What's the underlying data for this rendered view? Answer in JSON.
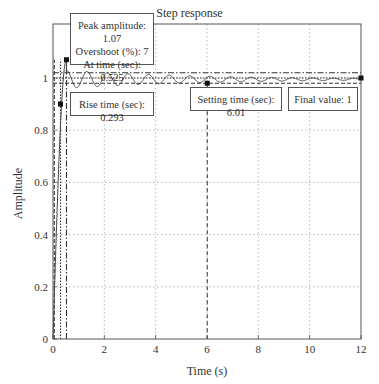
{
  "chart_data": {
    "type": "line",
    "title": "Step response",
    "xlabel": "Time (s)",
    "ylabel": "Amplitude",
    "xlim": [
      0,
      12
    ],
    "ylim": [
      0,
      1.1
    ],
    "xticks": [
      0,
      2,
      4,
      6,
      8,
      10,
      12
    ],
    "yticks": [
      0,
      0.2,
      0.4,
      0.6,
      0.8,
      1
    ],
    "grid": true,
    "series": [
      {
        "name": "Step response",
        "description": "Underdamped response rising from 0, peaking at 1.07 near t=0.525 s, then oscillating with small decaying amplitude around 1",
        "x": [
          0,
          0.15,
          0.293,
          0.4,
          0.525,
          0.7,
          1.0,
          1.3,
          1.6,
          2.0,
          2.5,
          3.0,
          4.0,
          5.0,
          6.01,
          8.0,
          10.0,
          12.0
        ],
        "y": [
          0,
          0.5,
          0.9,
          1.02,
          1.07,
          1.0,
          0.97,
          1.01,
          0.97,
          1.01,
          0.97,
          1.01,
          0.98,
          1.01,
          0.98,
          0.99,
          1.0,
          1.0
        ]
      }
    ],
    "reference_lines": [
      {
        "type": "horizontal",
        "y": 1.02,
        "style": "dash-dot",
        "label": "upper settling bound"
      },
      {
        "type": "horizontal",
        "y": 1.0,
        "style": "dotted",
        "label": "final value"
      },
      {
        "type": "horizontal",
        "y": 0.98,
        "style": "dashed",
        "label": "lower settling bound"
      },
      {
        "type": "vertical",
        "x": 0.293,
        "style": "dotted",
        "label": "rise time"
      },
      {
        "type": "vertical",
        "x": 0.525,
        "style": "dash-dot",
        "label": "peak time"
      },
      {
        "type": "vertical",
        "x": 0.05,
        "style": "dashed"
      }
    ],
    "markers": [
      {
        "name": "rise-time",
        "x": 0.293,
        "y": 0.9
      },
      {
        "name": "peak",
        "x": 0.525,
        "y": 1.07
      },
      {
        "name": "settling-time",
        "x": 6.01,
        "y": 0.98
      },
      {
        "name": "final-value",
        "x": 12,
        "y": 1.0
      }
    ],
    "annotations": [
      {
        "id": "peak",
        "lines": [
          "Peak amplitude: 1.07",
          "Overshoot (%): 7",
          "At time (sec): 0.525"
        ]
      },
      {
        "id": "rise",
        "lines": [
          "Rise time (sec): 0.293"
        ]
      },
      {
        "id": "settling",
        "lines": [
          "Setting time (sec): 6.01"
        ]
      },
      {
        "id": "final",
        "lines": [
          "Final value: 1"
        ]
      }
    ]
  },
  "labels": {
    "title": "Step response",
    "xlabel": "Time (s)",
    "ylabel": "Amplitude",
    "peak_line1": "Peak amplitude: 1.07",
    "peak_line2": "Overshoot (%): 7",
    "peak_line3": "At time (sec): 0.525",
    "rise": "Rise time (sec): 0.293",
    "settling": "Setting time (sec): 6.01",
    "final": "Final value: 1"
  }
}
